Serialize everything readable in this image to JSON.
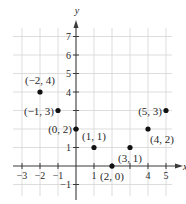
{
  "chart_data": {
    "type": "scatter",
    "title": "",
    "xlabel": "x",
    "ylabel": "y",
    "xlim": [
      -3.5,
      5.5
    ],
    "ylim": [
      -1.5,
      7.5
    ],
    "grid": true,
    "x_ticks": [
      -3,
      -2,
      -1,
      1,
      2,
      3,
      4,
      5
    ],
    "x_tick_labels": [
      "−3",
      "−2",
      "−1",
      "1",
      "",
      "",
      "4",
      "5"
    ],
    "y_ticks": [
      -1,
      1,
      2,
      3,
      4,
      5,
      6,
      7
    ],
    "y_tick_labels": [
      "−1",
      "1",
      "",
      "",
      "4",
      "5",
      "6",
      "7"
    ],
    "points": [
      {
        "x": -2,
        "y": 4,
        "label": "(−2, 4)"
      },
      {
        "x": -1,
        "y": 3,
        "label": "(−1, 3)"
      },
      {
        "x": 0,
        "y": 2,
        "label": "(0, 2)"
      },
      {
        "x": 1,
        "y": 1,
        "label": "(1, 1)"
      },
      {
        "x": 2,
        "y": 0,
        "label": "(2, 0)"
      },
      {
        "x": 3,
        "y": 1,
        "label": "(3, 1)"
      },
      {
        "x": 4,
        "y": 2,
        "label": "(4, 2)"
      },
      {
        "x": 5,
        "y": 3,
        "label": "(5, 3)"
      }
    ]
  },
  "colors": {
    "grid": "#d4d4d4",
    "axis": "#3a3a3a",
    "point": "#111111",
    "text": "#2a2a2a"
  }
}
